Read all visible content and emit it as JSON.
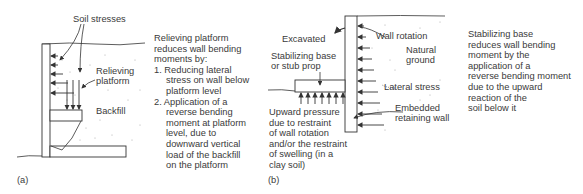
{
  "figure_a": {
    "panel_label": "(a)",
    "labels": {
      "soil_stresses": "Soil stresses",
      "relieving_platform_1": "Relieving",
      "relieving_platform_2": "platform",
      "backfill": "Backfill"
    },
    "description": {
      "intro_1": "Relieving platform",
      "intro_2": "reduces wall bending",
      "intro_3": "moments by:",
      "item1_1": "1. Reducing lateral",
      "item1_2": "stress on wall below",
      "item1_3": "platform level",
      "item2_1": "2. Application of a",
      "item2_2": "reverse bending",
      "item2_3": "moment at platform",
      "item2_4": "level, due to",
      "item2_5": "downward vertical",
      "item2_6": "load of the backfill",
      "item2_7": "on the platform"
    }
  },
  "figure_b": {
    "panel_label": "(b)",
    "labels": {
      "excavated": "Excavated",
      "stabilizing_1": "Stabilizing base",
      "stabilizing_2": "or stub prop",
      "wall_rotation": "Wall rotation",
      "natural_1": "Natural",
      "natural_2": "ground",
      "lateral_stress": "Lateral stress",
      "embedded_1": "Embedded",
      "embedded_2": "retaining wall",
      "upward_1": "Upward pressure",
      "upward_2": "due to restraint",
      "upward_3": "of wall rotation",
      "upward_4": "and/or the restraint",
      "upward_5": "of swelling (in a",
      "upward_6": "clay soil)"
    },
    "description": {
      "l1": "Stabilizing base",
      "l2": "reduces wall bending",
      "l3": "moment by the",
      "l4": "application of a",
      "l5": "reverse bending moment",
      "l6": "due to the upward",
      "l7": "reaction of the",
      "l8": "soil below it"
    }
  }
}
